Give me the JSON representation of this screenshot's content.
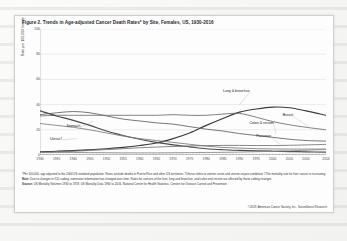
{
  "figure": {
    "title": "Figure 2. Trends in Age-adjusted Cancer Death Rates* by Site, Females, US, 1930-2016",
    "notes": {
      "footnote": "*Per 100,000, age adjusted to the 2000 US standard population. Rates exclude deaths in Puerto Rico and other US territories. †Uterus refers to uterine cervix and uterine corpus combined. ‡The mortality rate for liver cancer is increasing.",
      "note_label": "Note:",
      "note_text": "Due to changes in ICD coding, numerator information has changed over time. Rates for cancers of the liver, lung and bronchus, and colon and rectum are affected by these coding changes.",
      "source_label": "Source:",
      "source_text": "US Mortality Volumes 1930 to 1959, US Mortality Data 1960 to 2016, National Center for Health Statistics, Centers for Disease Control and Prevention.",
      "copyright": "©2019, American Cancer Society, Inc., Surveillance Research"
    }
  },
  "chart_data": {
    "type": "line",
    "xlabel": "",
    "ylabel": "Rate per 100,000 female population",
    "xlim": [
      1930,
      2016
    ],
    "ylim": [
      0,
      100
    ],
    "yticks": [
      0,
      20,
      40,
      60,
      80,
      100
    ],
    "xticks": [
      1930,
      1935,
      1940,
      1945,
      1950,
      1955,
      1960,
      1965,
      1970,
      1975,
      1980,
      1985,
      1990,
      1995,
      2000,
      2005,
      2010,
      2016
    ],
    "grid": true,
    "legend": "inline-labels",
    "x": [
      1930,
      1935,
      1940,
      1945,
      1950,
      1955,
      1960,
      1965,
      1970,
      1975,
      1980,
      1985,
      1990,
      1995,
      2000,
      2005,
      2010,
      2016
    ],
    "series": [
      {
        "name": "Lung & bronchus",
        "label": "Lung & bronchus",
        "color": "#3a3a3a",
        "values": [
          2.5,
          3.0,
          3.5,
          4.2,
          5.0,
          6.0,
          7.5,
          9.5,
          13.0,
          17.5,
          23.5,
          29.0,
          34.0,
          36.5,
          38.0,
          37.5,
          35.0,
          31.5
        ]
      },
      {
        "name": "Breast",
        "label": "Breast",
        "color": "#6a6a6a",
        "values": [
          31.0,
          31.5,
          31.5,
          31.5,
          31.5,
          31.5,
          31.5,
          31.5,
          32.0,
          31.5,
          31.5,
          32.5,
          33.0,
          30.0,
          26.5,
          24.0,
          22.0,
          20.0
        ]
      },
      {
        "name": "Colon & rectum",
        "label": "Colon & rectum",
        "color": "#5e5e5e",
        "values": [
          32.0,
          33.5,
          34.5,
          33.5,
          31.0,
          28.5,
          27.0,
          25.5,
          24.5,
          22.5,
          20.5,
          19.0,
          17.0,
          15.5,
          14.0,
          12.5,
          11.5,
          11.0
        ]
      },
      {
        "name": "Stomach",
        "label": "Stomach",
        "color": "#4a4a4a",
        "values": [
          35.0,
          31.0,
          27.5,
          23.5,
          19.0,
          15.5,
          12.5,
          10.0,
          8.0,
          6.5,
          5.0,
          4.2,
          3.7,
          3.3,
          3.0,
          2.7,
          2.5,
          2.3
        ]
      },
      {
        "name": "Uterus",
        "label": "Uterus†",
        "color": "#7a7a7a",
        "values": [
          25.0,
          23.5,
          22.0,
          20.0,
          17.5,
          15.0,
          13.0,
          11.5,
          10.0,
          8.5,
          7.0,
          6.0,
          5.5,
          5.0,
          4.8,
          4.7,
          4.7,
          4.7
        ]
      },
      {
        "name": "Pancreas",
        "label": "Pancreas",
        "color": "#707070",
        "values": [
          2.0,
          2.5,
          3.0,
          3.6,
          4.3,
          5.0,
          5.8,
          6.3,
          6.8,
          7.2,
          7.5,
          7.6,
          7.6,
          7.5,
          7.5,
          7.7,
          8.0,
          8.4
        ]
      },
      {
        "name": "Liver",
        "label": "Liver‡",
        "color": "#858585",
        "values": [
          2.0,
          2.0,
          2.0,
          1.9,
          1.8,
          1.7,
          1.7,
          1.7,
          1.8,
          1.9,
          2.0,
          2.1,
          2.3,
          2.6,
          2.9,
          3.3,
          3.8,
          4.4
        ]
      }
    ],
    "annotations": [
      {
        "text": "Lung & bronchus",
        "x": 1985,
        "y": 44
      },
      {
        "text": "Breast",
        "x": 2004,
        "y": 29
      },
      {
        "text": "Colon & rectum",
        "x": 1995,
        "y": 23
      },
      {
        "text": "Stomach",
        "x": 1940,
        "y": 20
      },
      {
        "text": "Uterus",
        "x": 1936,
        "y": 11
      },
      {
        "text": "Pancreas",
        "x": 1997,
        "y": 13
      }
    ]
  }
}
